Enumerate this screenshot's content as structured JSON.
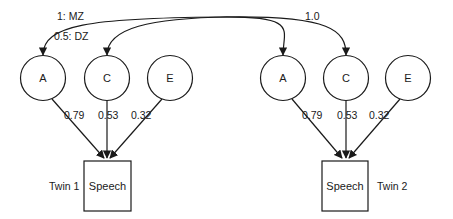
{
  "correlations": {
    "A_label_mz": "1: MZ",
    "A_label_dz": "0.5: DZ",
    "C_label": "1.0"
  },
  "twin1": {
    "label": "Twin 1",
    "observed": "Speech",
    "latents": [
      {
        "name": "A",
        "loading": "0.79"
      },
      {
        "name": "C",
        "loading": "0.53"
      },
      {
        "name": "E",
        "loading": "0.32"
      }
    ]
  },
  "twin2": {
    "label": "Twin 2",
    "observed": "Speech",
    "latents": [
      {
        "name": "A",
        "loading": "0.79"
      },
      {
        "name": "C",
        "loading": "0.53"
      },
      {
        "name": "E",
        "loading": "0.32"
      }
    ]
  },
  "colors": {
    "stroke": "#1a1a1a",
    "background": "#ffffff"
  }
}
